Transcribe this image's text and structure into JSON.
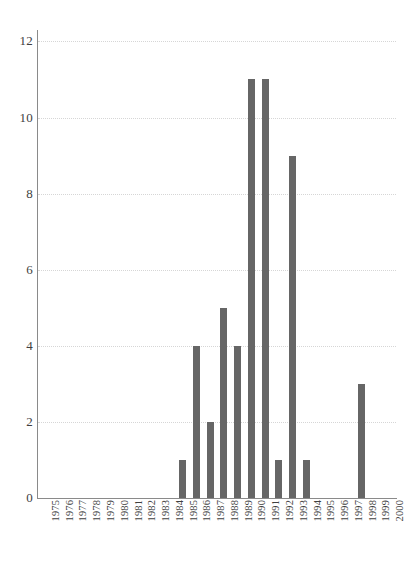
{
  "chart_data": {
    "type": "bar",
    "title": "",
    "subtitle": "",
    "xlabel": "",
    "ylabel": "",
    "categories": [
      "1975",
      "1976",
      "1977",
      "1978",
      "1979",
      "1980",
      "1981",
      "1982",
      "1983",
      "1984",
      "1985",
      "1986",
      "1987",
      "1988",
      "1989",
      "1990",
      "1991",
      "1992",
      "1993",
      "1994",
      "1995",
      "1996",
      "1997",
      "1998",
      "1999",
      "2000"
    ],
    "values": [
      0,
      0,
      0,
      0,
      0,
      0,
      0,
      0,
      0,
      0,
      1,
      4,
      2,
      5,
      4,
      11,
      11,
      1,
      9,
      1,
      0,
      0,
      0,
      3,
      0,
      0
    ],
    "ylim": [
      0,
      12.3
    ],
    "yticks": [
      0,
      2,
      4,
      6,
      8,
      10,
      12
    ],
    "ytick_labels": [
      "0",
      "2",
      "4",
      "6",
      "8",
      "10",
      "12"
    ],
    "grid": true,
    "grid_axis": "y",
    "grid_style": "dotted",
    "legend": false,
    "legend_position": "none",
    "xtick_rotation": 90,
    "bar_color": "#666666",
    "gridline_color": "#d6d6d6",
    "axis_color": "#8a8a8a",
    "background_color": "#ffffff",
    "text_color": "#3f3f3f",
    "annotations": []
  }
}
